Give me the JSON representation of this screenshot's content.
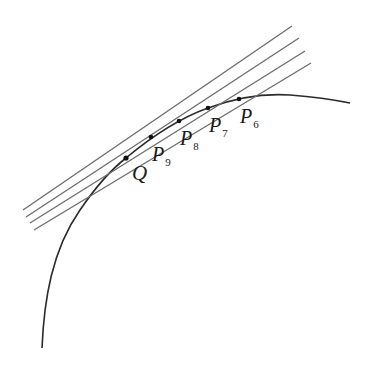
{
  "diagram": {
    "colors": {
      "curve": "#2a2a2a",
      "secant": "#6e6e6e",
      "point": "#111111",
      "label": "#1a1a1a"
    },
    "point_q": {
      "label": "Q",
      "x": 126,
      "y": 158
    },
    "points": [
      {
        "main": "P",
        "sub": "9",
        "x": 151,
        "y": 137
      },
      {
        "main": "P",
        "sub": "8",
        "x": 179,
        "y": 121
      },
      {
        "main": "P",
        "sub": "7",
        "x": 208,
        "y": 108
      },
      {
        "main": "P",
        "sub": "6",
        "x": 239,
        "y": 99
      }
    ],
    "secant_lines": [
      {
        "name": "Q-P9",
        "x1": 23,
        "y1": 210,
        "x2": 292,
        "y2": 26
      },
      {
        "name": "Q-P8",
        "x1": 26,
        "y1": 217,
        "x2": 299,
        "y2": 38
      },
      {
        "name": "Q-P7",
        "x1": 30,
        "y1": 223,
        "x2": 305,
        "y2": 51
      },
      {
        "name": "Q-P6",
        "x1": 34,
        "y1": 230,
        "x2": 311,
        "y2": 63
      }
    ]
  }
}
